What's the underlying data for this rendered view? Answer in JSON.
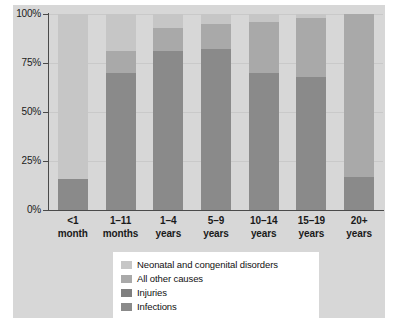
{
  "chart_data": {
    "type": "bar",
    "stacked": true,
    "title": "",
    "xlabel": "",
    "ylabel": "",
    "ylim": [
      0,
      100
    ],
    "ytick_labels": [
      "0%",
      "25%",
      "50%",
      "75%",
      "100%"
    ],
    "ytick_values": [
      0,
      25,
      50,
      75,
      100
    ],
    "grid": true,
    "legend_position": "bottom",
    "categories": [
      "<1 month",
      "1–11 months",
      "1–4 years",
      "5–9 years",
      "10–14 years",
      "15–19 years",
      "20+ years"
    ],
    "category_lines": [
      [
        "<1",
        "month"
      ],
      [
        "1–11",
        "months"
      ],
      [
        "1–4",
        "years"
      ],
      [
        "5–9",
        "years"
      ],
      [
        "10–14",
        "years"
      ],
      [
        "15–19",
        "years"
      ],
      [
        "20+",
        "years"
      ]
    ],
    "series": [
      {
        "name": "Infections",
        "color": "#8a8a8a",
        "values": [
          16,
          70,
          81,
          82,
          70,
          68,
          17
        ]
      },
      {
        "name": "Injuries",
        "color": "#8a8a8a",
        "values": [
          0,
          0,
          0,
          0,
          0,
          0,
          0
        ]
      },
      {
        "name": "All other causes",
        "color": "#a9a9a9",
        "values": [
          0,
          11,
          12,
          13,
          26,
          30,
          83
        ]
      },
      {
        "name": "Neonatal and congenital disorders",
        "color": "#c6c6c6",
        "values": [
          84,
          19,
          7,
          5,
          4,
          2,
          0
        ]
      }
    ],
    "stack_order_bottom_to_top": [
      "Infections",
      "Injuries",
      "All other causes",
      "Neonatal and congenital disorders"
    ],
    "legend_entries": [
      {
        "label": "Neonatal and congenital disorders",
        "color": "#c6c6c6"
      },
      {
        "label": "All other causes",
        "color": "#a9a9a9"
      },
      {
        "label": "Injuries",
        "color": "#7f7f7f"
      },
      {
        "label": "Infections",
        "color": "#8a8a8a"
      }
    ]
  },
  "colors": {
    "panel_background": "#d7d7d7",
    "plot_background": "#d7d7d7",
    "axis": "#4a4a4a",
    "gridline": "#c9c9c9",
    "text": "#1a1a1a",
    "legend_background": "#ffffff"
  }
}
